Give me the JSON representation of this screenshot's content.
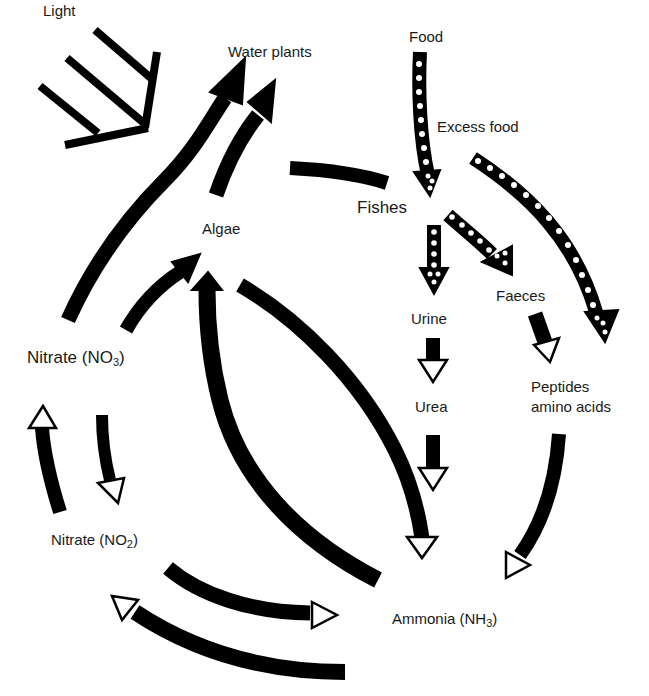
{
  "diagram": {
    "labels": {
      "light": "Light",
      "water_plants": "Water plants",
      "algae": "Algae",
      "food": "Food",
      "excess_food": "Excess food",
      "fishes": "Fishes",
      "faeces": "Faeces",
      "urine": "Urine",
      "urea": "Urea",
      "peptides_line1": "Peptides",
      "peptides_line2": "amino acids",
      "nitrate_no3_text": "Nitrate (NO",
      "nitrate_no3_sub": "3",
      "nitrate_no2_text": "Nitrate (NO",
      "nitrate_no2_sub": "2",
      "ammonia_text": "Ammonia (NH",
      "ammonia_sub": "3",
      "close_paren": ")"
    },
    "arrows": [
      {
        "from": "Light",
        "to": "Water plants / Algae",
        "style": "light-rays"
      },
      {
        "from": "Nitrate (NO3)",
        "to": "Water plants",
        "style": "solid-head"
      },
      {
        "from": "Algae",
        "to": "Water plants",
        "style": "solid-head"
      },
      {
        "from": "Nitrate (NO3)",
        "to": "Algae",
        "style": "solid-head"
      },
      {
        "from": "Ammonia (NH3)",
        "to": "Algae",
        "style": "solid-head"
      },
      {
        "from": "Algae",
        "to": "Ammonia (NH3)",
        "style": "open-head"
      },
      {
        "from": "Fishes",
        "to": "Water plants/Algae",
        "style": "line-no-head"
      },
      {
        "from": "Food",
        "to": "Fishes",
        "style": "dotted"
      },
      {
        "from": "Excess food",
        "to": "Peptides amino acids",
        "style": "dotted"
      },
      {
        "from": "Fishes",
        "to": "Urine",
        "style": "dotted"
      },
      {
        "from": "Fishes",
        "to": "Faeces",
        "style": "dotted"
      },
      {
        "from": "Urine",
        "to": "Urea",
        "style": "open-head"
      },
      {
        "from": "Urea",
        "to": "Ammonia (NH3)",
        "style": "open-head"
      },
      {
        "from": "Faeces",
        "to": "Peptides amino acids",
        "style": "open-head"
      },
      {
        "from": "Peptides amino acids",
        "to": "Ammonia (NH3)",
        "style": "open-head"
      },
      {
        "from": "Ammonia (NH3)",
        "to": "Nitrate (NO2)",
        "style": "open-head"
      },
      {
        "from": "Nitrate (NO2)",
        "to": "Ammonia (NH3)",
        "style": "open-head"
      },
      {
        "from": "Nitrate (NO2)",
        "to": "Nitrate (NO3)",
        "style": "open-head"
      },
      {
        "from": "Nitrate (NO3)",
        "to": "Nitrate (NO2)",
        "style": "open-head"
      }
    ],
    "colors": {
      "ink": "#000000",
      "background": "#ffffff",
      "text": "#1a1a1a"
    }
  }
}
